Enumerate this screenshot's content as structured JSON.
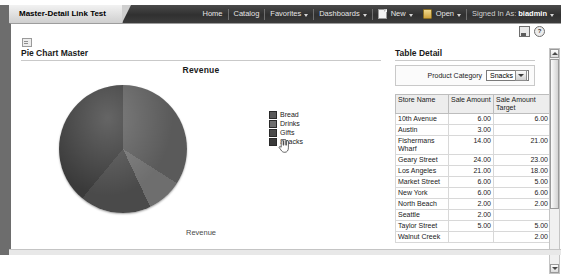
{
  "window": {
    "document_tab": "Master-Detail Link Test"
  },
  "globalnav": {
    "items": [
      {
        "label": "Home",
        "icon": "",
        "caret": false
      },
      {
        "label": "Catalog",
        "icon": "",
        "caret": false
      },
      {
        "label": "Favorites",
        "icon": "",
        "caret": true
      },
      {
        "label": "Dashboards",
        "icon": "",
        "caret": true
      },
      {
        "label": "New",
        "icon": "new-page-icon",
        "caret": true
      },
      {
        "label": "Open",
        "icon": "open-folder-icon",
        "caret": true
      }
    ],
    "signed_in_label": "Signed In As:",
    "signed_in_user": "biadmin"
  },
  "panel_icons": [
    {
      "name": "print-icon",
      "glyph": ""
    },
    {
      "name": "help-icon",
      "glyph": "?"
    }
  ],
  "master": {
    "title": "Pie Chart Master",
    "grip_icon": "collapse-grip-icon"
  },
  "detail": {
    "title": "Table Detail",
    "prompt_label": "Product Category",
    "prompt_value": "Snacks",
    "prompt_options": [
      "Snacks"
    ],
    "table": {
      "columns": [
        "Store Name",
        "Sale Amount",
        "Sale Amount Target"
      ],
      "rows": [
        {
          "store": "10th Avenue",
          "amount": "6.00",
          "target": "6.00"
        },
        {
          "store": "Austin",
          "amount": "3.00",
          "target": ""
        },
        {
          "store": "Fishermans Wharf",
          "amount": "14.00",
          "target": "21.00"
        },
        {
          "store": "Geary Street",
          "amount": "24.00",
          "target": "23.00"
        },
        {
          "store": "Los Angeles",
          "amount": "21.00",
          "target": "18.00"
        },
        {
          "store": "Market Street",
          "amount": "6.00",
          "target": "5.00"
        },
        {
          "store": "New York",
          "amount": "6.00",
          "target": "6.00"
        },
        {
          "store": "North Beach",
          "amount": "2.00",
          "target": "2.00"
        },
        {
          "store": "Seattle",
          "amount": "2.00",
          "target": ""
        },
        {
          "store": "Taylor Street",
          "amount": "5.00",
          "target": "5.00"
        },
        {
          "store": "Walnut Creek",
          "amount": "",
          "target": "2.00"
        }
      ]
    }
  },
  "chart_data": {
    "type": "pie",
    "title": "Revenue",
    "footer_label": "Revenue",
    "categories": [
      "Bread",
      "Drinks",
      "Gifts",
      "Snacks"
    ],
    "values": [
      34,
      9,
      18,
      39
    ],
    "colors": [
      "#5a5a5a",
      "#6e6e6e",
      "#4a4a4a",
      "#3a3a3a"
    ],
    "legend_position": "right",
    "xlabel": "",
    "ylabel": ""
  },
  "cursor": {
    "icon": "hand-pointer-cursor",
    "over": "Snacks"
  },
  "theme": {
    "header_bg": "#3b3b3b",
    "tab_bg": "#d8d8d8",
    "rule": "#c9c9c9",
    "table_header_bg": "#ededed"
  }
}
